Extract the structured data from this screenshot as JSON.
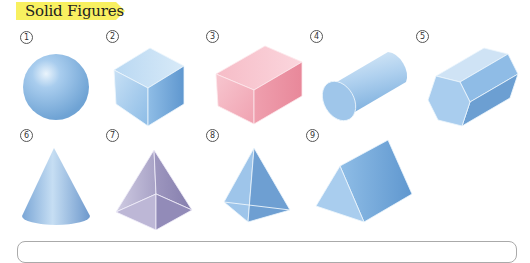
{
  "title": "Solid Figures",
  "colors": {
    "banner": "#f8f060",
    "blue": "#8fbfe8",
    "pink": "#f3aab8",
    "purple": "#a9a3c8"
  },
  "figures": [
    {
      "number": "1",
      "shape": "sphere"
    },
    {
      "number": "2",
      "shape": "cube"
    },
    {
      "number": "3",
      "shape": "rectangular-prism"
    },
    {
      "number": "4",
      "shape": "cylinder"
    },
    {
      "number": "5",
      "shape": "hexagonal-prism"
    },
    {
      "number": "6",
      "shape": "cone"
    },
    {
      "number": "7",
      "shape": "square-pyramid"
    },
    {
      "number": "8",
      "shape": "triangular-pyramid"
    },
    {
      "number": "9",
      "shape": "triangular-prism"
    }
  ]
}
